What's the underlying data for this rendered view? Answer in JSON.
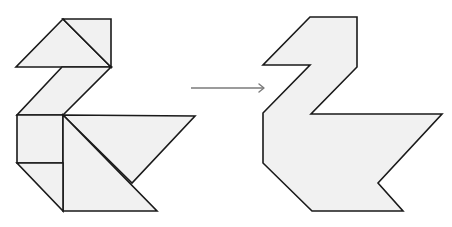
{
  "colors": {
    "fill": "#f1f1f1",
    "stroke": "#1a1a1a",
    "arrow": "#7a7a7a",
    "background": "#ffffff"
  },
  "left_figure": {
    "label": "tangram-pieces-swan",
    "piece_count": 7,
    "pieces": [
      {
        "name": "head-small-triangle",
        "shape": "triangle"
      },
      {
        "name": "head-medium-triangle",
        "shape": "triangle"
      },
      {
        "name": "neck-parallelogram",
        "shape": "parallelogram"
      },
      {
        "name": "chest-square",
        "shape": "square"
      },
      {
        "name": "body-large-triangle-top",
        "shape": "triangle"
      },
      {
        "name": "body-large-triangle-bottom",
        "shape": "triangle"
      },
      {
        "name": "tail-small-triangle",
        "shape": "triangle"
      }
    ]
  },
  "arrow": {
    "direction": "right",
    "meaning": "transforms-to"
  },
  "right_figure": {
    "label": "swan-silhouette-outline"
  }
}
